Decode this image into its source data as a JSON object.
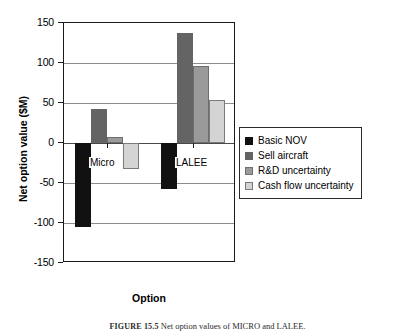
{
  "figure": {
    "caption_number": "FIGURE 15.5",
    "caption_text": "Net option values of MICRO and LALEE."
  },
  "axes": {
    "y_title": "Net option value ($M)",
    "x_title": "Option",
    "y_ticks": [
      "150",
      "100",
      "50",
      "0",
      "-50",
      "-100",
      "-150"
    ]
  },
  "legend": {
    "items": [
      {
        "label": "Basic NOV",
        "color": "#111111",
        "swatch": "legend-swatch-basic-nov"
      },
      {
        "label": "Sell aircraft",
        "color": "#646464",
        "swatch": "legend-swatch-sell-aircraft"
      },
      {
        "label": "R&D uncertainty",
        "color": "#9a9a9a",
        "swatch": "legend-swatch-rd-uncertainty"
      },
      {
        "label": "Cash flow uncertainty",
        "color": "#d4d4d4",
        "swatch": "legend-swatch-cash-flow-uncertainty"
      }
    ]
  },
  "group_labels": [
    "Micro",
    "LALEE"
  ],
  "chart_data": {
    "type": "bar",
    "title": "",
    "xlabel": "Option",
    "ylabel": "Net option value ($M)",
    "ylim": [
      -150,
      150
    ],
    "yticks": [
      150,
      100,
      50,
      0,
      -50,
      -100,
      -150
    ],
    "grid": true,
    "legend_position": "right",
    "categories": [
      "Micro",
      "LALEE"
    ],
    "series": [
      {
        "name": "Basic NOV",
        "color": "#111111",
        "values": [
          -105,
          -58
        ]
      },
      {
        "name": "Sell aircraft",
        "color": "#646464",
        "values": [
          43,
          138
        ]
      },
      {
        "name": "R&D uncertainty",
        "color": "#9a9a9a",
        "values": [
          8,
          96
        ]
      },
      {
        "name": "Cash flow uncertainty",
        "color": "#d4d4d4",
        "values": [
          -33,
          54
        ]
      }
    ]
  }
}
